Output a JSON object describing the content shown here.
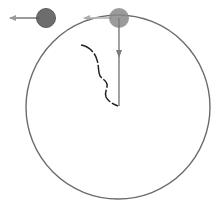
{
  "diagram": {
    "title": "Circular motion diagram",
    "colors": {
      "circle": "#6b6b6b",
      "ball_left": "#5e5e5e",
      "ball_top": "#8a8a8a",
      "radius_arrow": "#7a7a7a",
      "velocity_arrow": "#9a9a9a",
      "trajectory": "#222222"
    },
    "circle": {
      "cx": 118,
      "cy": 107,
      "r": 92
    },
    "balls": [
      {
        "name": "left-ball",
        "cx": 46,
        "cy": 18,
        "r": 10
      },
      {
        "name": "top-ball",
        "cx": 119,
        "cy": 18,
        "r": 10
      }
    ],
    "arrows": [
      {
        "name": "left-ball-velocity",
        "x1": 40,
        "y1": 18,
        "x2": 10,
        "y2": 18
      },
      {
        "name": "top-ball-velocity",
        "x1": 112,
        "y1": 18,
        "x2": 84,
        "y2": 18
      },
      {
        "name": "radius-arrow",
        "x1": 119,
        "y1": 18,
        "x2": 119,
        "y2": 106
      }
    ],
    "labels": []
  }
}
